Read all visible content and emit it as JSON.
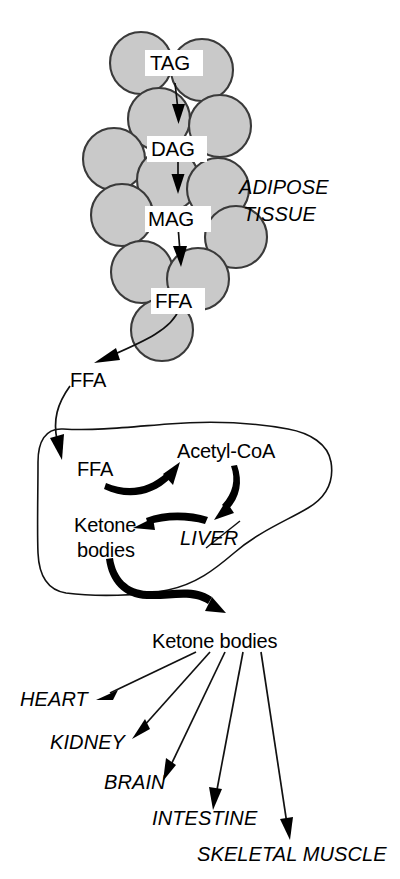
{
  "figure": {
    "background_color": "#ffffff",
    "ink_color": "#000000",
    "cell_fill_color": "#c9c9c9",
    "cell_stroke_color": "#3a3a3a"
  },
  "tissues": {
    "adipose": {
      "label_line1": "ADIPOSE",
      "label_line2": "TISSUE",
      "style": "italic"
    },
    "liver": {
      "label": "LIVER",
      "style": "italic"
    }
  },
  "adipose_pathway": {
    "steps": [
      {
        "label": "TAG"
      },
      {
        "label": "DAG"
      },
      {
        "label": "MAG"
      },
      {
        "label": "FFA"
      }
    ]
  },
  "circulation": {
    "ffa_released_label": "FFA"
  },
  "liver_pathway": {
    "ffa_label": "FFA",
    "acetyl_coa_label": "Acetyl-CoA",
    "ketone_bodies_line1": "Ketone",
    "ketone_bodies_line2": "bodies"
  },
  "blood": {
    "ketone_bodies_label": "Ketone bodies"
  },
  "target_organs": [
    {
      "label": "HEART"
    },
    {
      "label": "KIDNEY"
    },
    {
      "label": "BRAIN"
    },
    {
      "label": "INTESTINE"
    },
    {
      "label": "SKELETAL MUSCLE"
    }
  ]
}
